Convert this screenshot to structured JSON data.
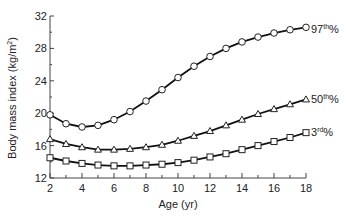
{
  "chart_data": {
    "type": "line",
    "title": "",
    "xlabel": "Age (yr)",
    "ylabel": "Body mass index (kg/m²)",
    "xlim": [
      2,
      18
    ],
    "ylim": [
      12,
      32
    ],
    "x_ticks": [
      2,
      4,
      6,
      8,
      10,
      12,
      14,
      16,
      18
    ],
    "y_ticks": [
      12,
      16,
      20,
      24,
      28,
      32
    ],
    "grid": false,
    "legend_position": "inline-right",
    "x": [
      2,
      3,
      4,
      5,
      6,
      7,
      8,
      9,
      10,
      11,
      12,
      13,
      14,
      15,
      16,
      17,
      18
    ],
    "series": [
      {
        "name": "97th%",
        "marker": "circle",
        "values": [
          19.8,
          18.7,
          18.3,
          18.5,
          19.2,
          20.2,
          21.5,
          22.9,
          24.4,
          25.8,
          27.0,
          28.0,
          28.8,
          29.4,
          29.9,
          30.3,
          30.6
        ]
      },
      {
        "name": "50th%",
        "marker": "triangle",
        "values": [
          16.8,
          16.2,
          15.8,
          15.5,
          15.5,
          15.6,
          15.8,
          16.1,
          16.6,
          17.2,
          17.8,
          18.5,
          19.2,
          19.9,
          20.5,
          21.1,
          21.7
        ]
      },
      {
        "name": "3rd%",
        "marker": "square",
        "values": [
          14.5,
          14.1,
          13.8,
          13.6,
          13.5,
          13.5,
          13.6,
          13.7,
          13.9,
          14.2,
          14.6,
          15.0,
          15.5,
          16.0,
          16.5,
          17.0,
          17.6
        ]
      }
    ]
  },
  "labels": {
    "y_axis": "Body mass index (kg/m",
    "y_axis_sup": "2",
    "y_axis_end": ")",
    "x_axis": "Age (yr)",
    "series_97": {
      "num": "97",
      "sup": "th",
      "pct": "%"
    },
    "series_50": {
      "num": "50",
      "sup": "th",
      "pct": "%"
    },
    "series_3": {
      "num": "3",
      "sup": "rd",
      "pct": "%"
    }
  }
}
